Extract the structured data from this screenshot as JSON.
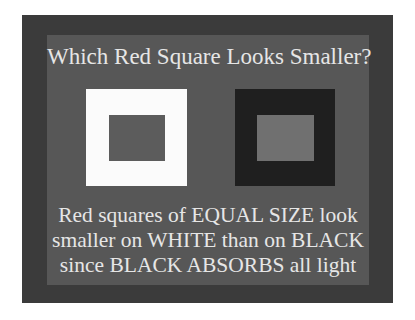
{
  "slide": {
    "title": "Which Red Square Looks Smaller?",
    "caption_lines": [
      "Red squares of EQUAL SIZE look",
      "smaller on WHITE than on BLACK",
      "since BLACK ABSORBS all light"
    ],
    "colors": {
      "frame": "#3b3b3b",
      "panel": "#575757",
      "white_square": "#fbfbfb",
      "black_square": "#1f1f1f",
      "inner_square_on_white": "#5c5c5c",
      "inner_square_on_black": "#707070",
      "text": "#e6e6e6"
    }
  }
}
